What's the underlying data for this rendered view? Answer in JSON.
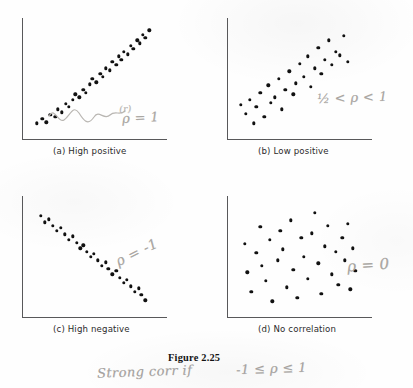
{
  "figure": {
    "caption": "Figure 2.25",
    "panels": [
      {
        "id": "a",
        "caption": "(a) High positive",
        "annotation_primary": "ρ = 1",
        "annotation_secondary": "(r)",
        "correlation": "high positive"
      },
      {
        "id": "b",
        "caption": "(b) Low positive",
        "annotation_primary": "½ < ρ < 1",
        "correlation": "low positive"
      },
      {
        "id": "c",
        "caption": "(c) High negative",
        "annotation_primary": "ρ = -1",
        "correlation": "high negative"
      },
      {
        "id": "d",
        "caption": "(d) No correlation",
        "annotation_primary": "ρ = 0",
        "correlation": "none"
      }
    ],
    "handwritten_note_bottom": "Strong corr if",
    "handwritten_note_bottom_math": "-1 ≤ ρ ≤ 1"
  },
  "chart_data": [
    {
      "type": "scatter",
      "title": "(a) High positive",
      "xlabel": "",
      "ylabel": "",
      "xlim": [
        0,
        100
      ],
      "ylim": [
        0,
        100
      ],
      "grid": false,
      "legend": "none",
      "annotations": [
        "(r)",
        "ρ = 1"
      ],
      "points": [
        [
          6,
          9
        ],
        [
          10,
          13
        ],
        [
          13,
          10
        ],
        [
          16,
          17
        ],
        [
          20,
          15
        ],
        [
          22,
          22
        ],
        [
          25,
          19
        ],
        [
          28,
          27
        ],
        [
          30,
          24
        ],
        [
          33,
          31
        ],
        [
          35,
          36
        ],
        [
          38,
          33
        ],
        [
          41,
          40
        ],
        [
          43,
          37
        ],
        [
          46,
          45
        ],
        [
          48,
          50
        ],
        [
          51,
          47
        ],
        [
          54,
          55
        ],
        [
          56,
          52
        ],
        [
          58,
          60
        ],
        [
          61,
          58
        ],
        [
          63,
          66
        ],
        [
          66,
          63
        ],
        [
          68,
          71
        ],
        [
          70,
          68
        ],
        [
          72,
          75
        ],
        [
          75,
          73
        ],
        [
          77,
          81
        ],
        [
          79,
          78
        ],
        [
          82,
          86
        ],
        [
          84,
          83
        ],
        [
          86,
          91
        ],
        [
          88,
          88
        ],
        [
          91,
          95
        ]
      ]
    },
    {
      "type": "scatter",
      "title": "(b) Low positive",
      "xlabel": "",
      "ylabel": "",
      "xlim": [
        0,
        100
      ],
      "ylim": [
        0,
        100
      ],
      "grid": false,
      "legend": "none",
      "annotations": [
        "½ < ρ < 1"
      ],
      "points": [
        [
          5,
          26
        ],
        [
          9,
          18
        ],
        [
          12,
          31
        ],
        [
          15,
          9
        ],
        [
          17,
          24
        ],
        [
          20,
          37
        ],
        [
          23,
          15
        ],
        [
          26,
          44
        ],
        [
          28,
          28
        ],
        [
          31,
          33
        ],
        [
          34,
          50
        ],
        [
          36,
          22
        ],
        [
          39,
          40
        ],
        [
          42,
          57
        ],
        [
          45,
          36
        ],
        [
          47,
          46
        ],
        [
          50,
          64
        ],
        [
          53,
          52
        ],
        [
          56,
          71
        ],
        [
          58,
          43
        ],
        [
          61,
          60
        ],
        [
          64,
          79
        ],
        [
          66,
          55
        ],
        [
          69,
          68
        ],
        [
          72,
          86
        ],
        [
          74,
          63
        ],
        [
          77,
          75
        ],
        [
          80,
          72
        ],
        [
          83,
          90
        ],
        [
          86,
          66
        ]
      ]
    },
    {
      "type": "scatter",
      "title": "(c) High negative",
      "xlabel": "",
      "ylabel": "",
      "xlim": [
        0,
        100
      ],
      "ylim": [
        0,
        100
      ],
      "grid": false,
      "legend": "none",
      "annotations": [
        "ρ = -1"
      ],
      "points": [
        [
          9,
          88
        ],
        [
          12,
          82
        ],
        [
          15,
          85
        ],
        [
          18,
          79
        ],
        [
          21,
          74
        ],
        [
          24,
          77
        ],
        [
          27,
          71
        ],
        [
          30,
          66
        ],
        [
          33,
          69
        ],
        [
          36,
          63
        ],
        [
          39,
          58
        ],
        [
          41,
          61
        ],
        [
          44,
          55
        ],
        [
          47,
          50
        ],
        [
          49,
          53
        ],
        [
          52,
          47
        ],
        [
          55,
          42
        ],
        [
          58,
          45
        ],
        [
          60,
          39
        ],
        [
          63,
          34
        ],
        [
          66,
          37
        ],
        [
          69,
          31
        ],
        [
          72,
          26
        ],
        [
          74,
          29
        ],
        [
          77,
          23
        ],
        [
          80,
          18
        ],
        [
          83,
          21
        ],
        [
          85,
          15
        ],
        [
          88,
          10
        ]
      ]
    },
    {
      "type": "scatter",
      "title": "(d) No correlation",
      "xlabel": "",
      "ylabel": "",
      "xlim": [
        0,
        100
      ],
      "ylim": [
        0,
        100
      ],
      "grid": false,
      "legend": "none",
      "annotations": [
        "ρ = 0"
      ],
      "points": [
        [
          8,
          62
        ],
        [
          10,
          36
        ],
        [
          13,
          18
        ],
        [
          17,
          54
        ],
        [
          20,
          78
        ],
        [
          21,
          42
        ],
        [
          24,
          28
        ],
        [
          27,
          66
        ],
        [
          29,
          9
        ],
        [
          33,
          47
        ],
        [
          35,
          74
        ],
        [
          37,
          57
        ],
        [
          40,
          22
        ],
        [
          43,
          84
        ],
        [
          45,
          38
        ],
        [
          48,
          12
        ],
        [
          51,
          68
        ],
        [
          53,
          50
        ],
        [
          56,
          30
        ],
        [
          59,
          72
        ],
        [
          61,
          91
        ],
        [
          64,
          44
        ],
        [
          66,
          16
        ],
        [
          69,
          60
        ],
        [
          71,
          79
        ],
        [
          74,
          34
        ],
        [
          77,
          55
        ],
        [
          79,
          24
        ],
        [
          82,
          68
        ],
        [
          84,
          47
        ],
        [
          86,
          81
        ],
        [
          88,
          20
        ],
        [
          90,
          58
        ],
        [
          92,
          37
        ]
      ]
    }
  ]
}
